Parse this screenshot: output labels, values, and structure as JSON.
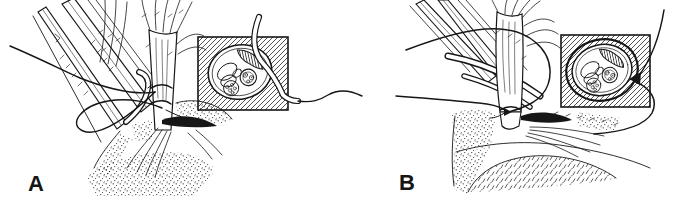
{
  "figure": {
    "background_color": "#ffffff",
    "ink_color": "#161616",
    "panels": [
      {
        "label": "A"
      },
      {
        "label": "B"
      }
    ]
  }
}
